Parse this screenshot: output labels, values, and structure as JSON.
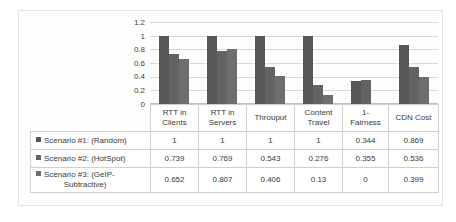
{
  "chart_data": {
    "type": "bar",
    "title": "",
    "xlabel": "",
    "ylabel": "",
    "ylim": [
      0,
      1.2
    ],
    "grid": true,
    "legend_position": "table-left",
    "yticks": [
      "1.2",
      "1",
      "0.8",
      "0.6",
      "0.4",
      "0.2",
      "0"
    ],
    "ytick_values": [
      1.2,
      1,
      0.8,
      0.6,
      0.4,
      0.2,
      0
    ],
    "categories": [
      "RTT in Clients",
      "RTT in Servers",
      "Throuput",
      "Content Travel",
      "1- Fairness",
      "CDN Cost"
    ],
    "category_lines": [
      [
        "RTT in",
        "Clients"
      ],
      [
        "RTT in",
        "Servers"
      ],
      [
        "Throuput",
        ""
      ],
      [
        "Content",
        "Travel"
      ],
      [
        "1-",
        "Fairness"
      ],
      [
        "CDN Cost",
        ""
      ]
    ],
    "series": [
      {
        "name": "Scenario #1: (Random)",
        "color": "#575757",
        "values": [
          1,
          1,
          1,
          1,
          0.344,
          0.869
        ],
        "labels": [
          "1",
          "1",
          "1",
          "1",
          "0.344",
          "0.869"
        ]
      },
      {
        "name": "Scenario #2: (HotSpot)",
        "color": "#636363",
        "values": [
          0.739,
          0.769,
          0.543,
          0.276,
          0.355,
          0.536
        ],
        "labels": [
          "0.739",
          "0.769",
          "0.543",
          "0.276",
          "0.355",
          "0.536"
        ]
      },
      {
        "name": "Scenario #3: (GeIP-Subtractive)",
        "name_line1": "Scenario #3: (GeIP-",
        "name_line2": "Subtractive)",
        "color": "#6e6e6e",
        "values": [
          0.652,
          0.807,
          0.406,
          0.13,
          0,
          0.399
        ],
        "labels": [
          "0.652",
          "0.807",
          "0.406",
          "0.13",
          "0",
          "0.399"
        ]
      }
    ]
  },
  "legend": {
    "items": [
      {
        "label": "Scenario #1: (Random)"
      },
      {
        "label": "Scenario #2: (HotSpot)"
      },
      {
        "label_line1": "Scenario #3: (GeIP-",
        "label_line2": "Subtractive)"
      }
    ]
  },
  "colors": {
    "series1": "#575757",
    "series2": "#636363",
    "series3": "#6e6e6e",
    "gridline": "#d9d9d9",
    "table_border": "#d0d0d0",
    "text": "#3a3a3a"
  }
}
